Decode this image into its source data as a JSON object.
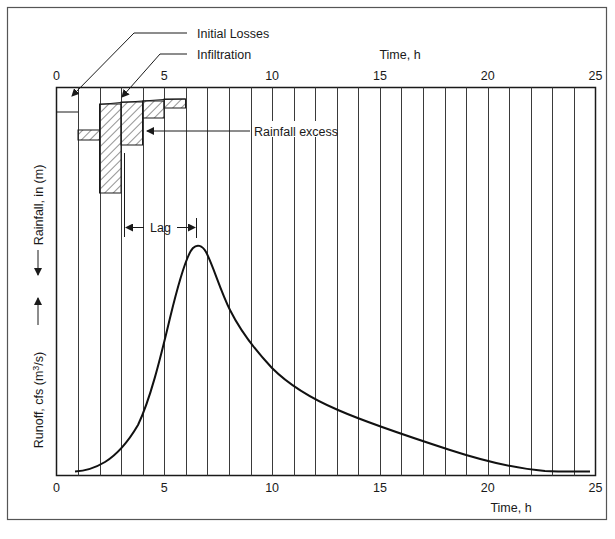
{
  "chart_data": {
    "type": "line",
    "title": "",
    "xlabel": "Time, h",
    "xlabel_top": "Time, h",
    "ylabel_top": "Rainfall, in (m)",
    "ylabel_bottom": "Runoff, cfs (m3/s)",
    "xlim": [
      0,
      25
    ],
    "x_ticks": [
      "0",
      "5",
      "10",
      "15",
      "20",
      "25"
    ],
    "grid": {
      "vertical": true,
      "interval_h": 1
    },
    "legend": null,
    "annotations": {
      "initial_losses": "Initial Losses",
      "infiltration": "Infiltration",
      "rainfall_excess": "Rainfall excess",
      "lag": "Lag"
    },
    "hyetograph": {
      "type": "bar",
      "orientation": "hanging from top",
      "categories": [
        "0-1",
        "1-2",
        "2-3",
        "3-4",
        "4-5",
        "5-6"
      ],
      "rainfall_depth_px": [
        24,
        52,
        105,
        57,
        30,
        20
      ],
      "losses_depth_px": [
        24,
        42,
        16,
        14,
        13,
        11
      ],
      "excess_depth_px": [
        0,
        10,
        89,
        43,
        17,
        9
      ],
      "note": "relative depths read from pixel heights; no numeric rainfall scale shown"
    },
    "series": [
      {
        "name": "Runoff hydrograph",
        "x": [
          0.9,
          2,
          3,
          4,
          5,
          5.6,
          6.1,
          6.5,
          7,
          7.5,
          8,
          9,
          10,
          11,
          12,
          13,
          15,
          17,
          19,
          21,
          22.5,
          24.8
        ],
        "y_rel": [
          0.0,
          0.03,
          0.12,
          0.28,
          0.56,
          0.82,
          0.97,
          1.0,
          0.92,
          0.77,
          0.7,
          0.56,
          0.46,
          0.38,
          0.32,
          0.27,
          0.2,
          0.13,
          0.06,
          0.02,
          0.0,
          0.0
        ],
        "note": "y normalized to peak = 1.0; peak at ~6.5 h"
      }
    ],
    "lag": {
      "start_h": 3.1,
      "end_h": 6.4
    }
  },
  "labels": {
    "initial_losses": "Initial Losses",
    "infiltration": "Infiltration",
    "rainfall_excess": "Rainfall excess",
    "lag": "Lag",
    "time_top": "Time, h",
    "time_bottom": "Time, h",
    "rainfall_axis": "Rainfall, in (m)",
    "runoff_axis_prefix": "Runoff, cfs (m",
    "runoff_axis_sup": "3",
    "runoff_axis_suffix": "/s)",
    "ticks_top": [
      "0",
      "5",
      "10",
      "15",
      "20",
      "25"
    ],
    "ticks_bottom": [
      "0",
      "5",
      "10",
      "15",
      "20",
      "25"
    ]
  },
  "colors": {
    "line": "#1a1a1a",
    "grid": "#3a3a3a",
    "hatch": "#2a2a2a",
    "background": "#ffffff"
  }
}
